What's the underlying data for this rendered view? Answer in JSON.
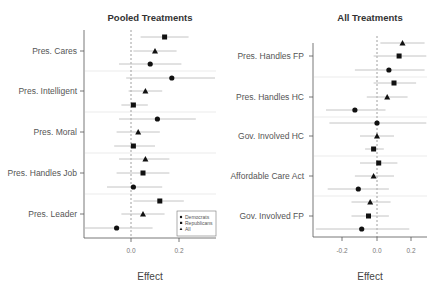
{
  "chart_data": [
    {
      "type": "scatter",
      "subtype": "coefficient-plot",
      "title": "Pooled Treatments",
      "xlabel": "Effect",
      "ylabel": "",
      "xlim": [
        -0.2,
        0.35
      ],
      "xticks": [
        0.0,
        0.2
      ],
      "xtick_labels": [
        "0.0",
        "0.2"
      ],
      "reference_line": 0.0,
      "legend": {
        "position": "bottom-right",
        "entries": [
          {
            "label": "Democrats",
            "marker": "circle"
          },
          {
            "label": "Republicans",
            "marker": "square"
          },
          {
            "label": "All",
            "marker": "triangle"
          }
        ]
      },
      "categories": [
        "Pres. Cares",
        "Pres. Intelligent",
        "Pres. Moral",
        "Pres. Handles Job",
        "Pres. Leader"
      ],
      "points": [
        {
          "category": "Pres. Cares",
          "group": "Republicans",
          "marker": "square",
          "y": 37,
          "est": 0.14,
          "lo": 0.04,
          "hi": 0.24
        },
        {
          "category": "Pres. Cares",
          "group": "All",
          "marker": "triangle",
          "y": 51,
          "est": 0.1,
          "lo": 0.01,
          "hi": 0.19
        },
        {
          "category": "Pres. Cares",
          "group": "Democrats",
          "marker": "circle",
          "y": 64,
          "est": 0.08,
          "lo": -0.05,
          "hi": 0.21
        },
        {
          "category": "Pres. Intelligent",
          "group": "Democrats",
          "marker": "circle",
          "y": 78,
          "est": 0.17,
          "lo": -0.02,
          "hi": 0.35
        },
        {
          "category": "Pres. Intelligent",
          "group": "All",
          "marker": "triangle",
          "y": 91,
          "est": 0.06,
          "lo": -0.01,
          "hi": 0.13
        },
        {
          "category": "Pres. Intelligent",
          "group": "Republicans",
          "marker": "square",
          "y": 105,
          "est": 0.01,
          "lo": -0.04,
          "hi": 0.07
        },
        {
          "category": "Pres. Moral",
          "group": "Democrats",
          "marker": "circle",
          "y": 119,
          "est": 0.11,
          "lo": -0.05,
          "hi": 0.27
        },
        {
          "category": "Pres. Moral",
          "group": "All",
          "marker": "triangle",
          "y": 132,
          "est": 0.03,
          "lo": -0.06,
          "hi": 0.12
        },
        {
          "category": "Pres. Moral",
          "group": "Republicans",
          "marker": "square",
          "y": 146,
          "est": 0.01,
          "lo": -0.07,
          "hi": 0.1
        },
        {
          "category": "Pres. Handles Job",
          "group": "All",
          "marker": "triangle",
          "y": 159,
          "est": 0.06,
          "lo": -0.05,
          "hi": 0.16
        },
        {
          "category": "Pres. Handles Job",
          "group": "Republicans",
          "marker": "square",
          "y": 173,
          "est": 0.05,
          "lo": -0.06,
          "hi": 0.16
        },
        {
          "category": "Pres. Handles Job",
          "group": "Democrats",
          "marker": "circle",
          "y": 187,
          "est": 0.01,
          "lo": -0.1,
          "hi": 0.13
        },
        {
          "category": "Pres. Leader",
          "group": "Republicans",
          "marker": "square",
          "y": 201,
          "est": 0.12,
          "lo": 0.01,
          "hi": 0.22
        },
        {
          "category": "Pres. Leader",
          "group": "All",
          "marker": "triangle",
          "y": 214,
          "est": 0.05,
          "lo": -0.04,
          "hi": 0.14
        },
        {
          "category": "Pres. Leader",
          "group": "Democrats",
          "marker": "circle",
          "y": 228,
          "est": -0.06,
          "lo": -0.2,
          "hi": 0.09
        }
      ]
    },
    {
      "type": "scatter",
      "subtype": "coefficient-plot",
      "title": "All Treatments",
      "xlabel": "Effect",
      "ylabel": "",
      "xlim": [
        -0.37,
        0.3
      ],
      "xticks": [
        -0.2,
        0.0,
        0.2
      ],
      "xtick_labels": [
        "-0.2",
        "0.0",
        "0.2"
      ],
      "reference_line": 0.0,
      "categories": [
        "Pres. Handles FP",
        "Pres. Handles HC",
        "Gov. Involved HC",
        "Affordable Care Act",
        "Gov. Involved FP"
      ],
      "points": [
        {
          "category": "Pres. Handles FP",
          "group": "All",
          "marker": "triangle",
          "y": 43,
          "est": 0.15,
          "lo": 0.02,
          "hi": 0.28
        },
        {
          "category": "Pres. Handles FP",
          "group": "Republicans",
          "marker": "square",
          "y": 56,
          "est": 0.13,
          "lo": -0.02,
          "hi": 0.29
        },
        {
          "category": "Pres. Handles FP",
          "group": "Democrats",
          "marker": "circle",
          "y": 70,
          "est": 0.07,
          "lo": -0.13,
          "hi": 0.28
        },
        {
          "category": "Pres. Handles HC",
          "group": "Republicans",
          "marker": "square",
          "y": 83,
          "est": 0.1,
          "lo": -0.02,
          "hi": 0.23
        },
        {
          "category": "Pres. Handles HC",
          "group": "All",
          "marker": "triangle",
          "y": 97,
          "est": 0.06,
          "lo": -0.06,
          "hi": 0.18
        },
        {
          "category": "Pres. Handles HC",
          "group": "Democrats",
          "marker": "circle",
          "y": 110,
          "est": -0.13,
          "lo": -0.3,
          "hi": 0.05
        },
        {
          "category": "Gov. Involved HC",
          "group": "Democrats",
          "marker": "circle",
          "y": 123,
          "est": 0.0,
          "lo": -0.28,
          "hi": 0.29
        },
        {
          "category": "Gov. Involved HC",
          "group": "All",
          "marker": "triangle",
          "y": 136,
          "est": 0.0,
          "lo": -0.1,
          "hi": 0.1
        },
        {
          "category": "Gov. Involved HC",
          "group": "Republicans",
          "marker": "square",
          "y": 149,
          "est": -0.02,
          "lo": -0.07,
          "hi": 0.04
        },
        {
          "category": "Affordable Care Act",
          "group": "Republicans",
          "marker": "square",
          "y": 163,
          "est": 0.01,
          "lo": -0.1,
          "hi": 0.12
        },
        {
          "category": "Affordable Care Act",
          "group": "All",
          "marker": "triangle",
          "y": 176,
          "est": -0.02,
          "lo": -0.13,
          "hi": 0.1
        },
        {
          "category": "Affordable Care Act",
          "group": "Democrats",
          "marker": "circle",
          "y": 189,
          "est": -0.11,
          "lo": -0.29,
          "hi": 0.07
        },
        {
          "category": "Gov. Involved FP",
          "group": "All",
          "marker": "triangle",
          "y": 202,
          "est": -0.04,
          "lo": -0.15,
          "hi": 0.08
        },
        {
          "category": "Gov. Involved FP",
          "group": "Republicans",
          "marker": "square",
          "y": 216,
          "est": -0.05,
          "lo": -0.15,
          "hi": 0.07
        },
        {
          "category": "Gov. Involved FP",
          "group": "Democrats",
          "marker": "circle",
          "y": 229,
          "est": -0.09,
          "lo": -0.36,
          "hi": 0.19
        }
      ]
    }
  ],
  "panels": {
    "left": {
      "title": "Pooled Treatments",
      "xlabel": "Effect",
      "ylabels": [
        "Pres. Cares",
        "Pres. Intelligent",
        "Pres. Moral",
        "Pres. Handles Job",
        "Pres. Leader"
      ],
      "ticks": [
        "0.0",
        "0.2"
      ],
      "legend": [
        "Democrats",
        "Republicans",
        "All"
      ]
    },
    "right": {
      "title": "All Treatments",
      "xlabel": "Effect",
      "ylabels": [
        "Pres. Handles FP",
        "Pres. Handles HC",
        "Gov. Involved HC",
        "Affordable Care Act",
        "Gov. Involved FP"
      ],
      "ticks": [
        "-0.2",
        "0.0",
        "0.2"
      ]
    }
  },
  "colors": {
    "marker": "#111111",
    "ci_line": "#bdbdbd",
    "separator": "#e6e6e6",
    "zero_line": "#888888",
    "axis": "#555555"
  }
}
